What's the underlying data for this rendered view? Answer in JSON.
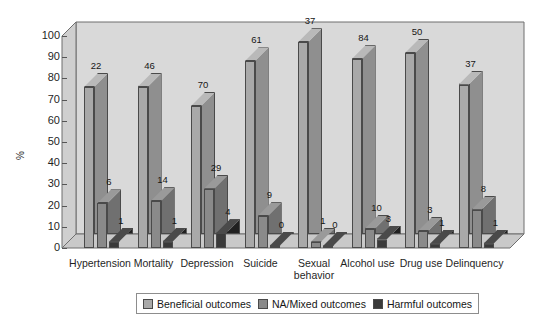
{
  "chart_data": {
    "type": "bar",
    "title": "",
    "xlabel": "",
    "ylabel": "%",
    "ylim": [
      0,
      100
    ],
    "yticks": [
      0,
      10,
      20,
      30,
      40,
      50,
      60,
      70,
      80,
      90,
      100
    ],
    "grid": false,
    "legend_position": "bottom",
    "categories": [
      "Hypertension",
      "Mortality",
      "Depression",
      "Suicide",
      "Sexual behavior",
      "Alcohol use",
      "Drug use",
      "Delinquency"
    ],
    "series": [
      {
        "name": "Beneficial outcomes",
        "color": "#a9a9a9",
        "values": [
          76,
          76,
          67,
          88,
          97,
          89,
          92,
          77
        ],
        "point_labels": [
          "22",
          "46",
          "70",
          "61",
          "37",
          "84",
          "50",
          "37"
        ]
      },
      {
        "name": "NA/Mixed outcomes",
        "color": "#8a8a8a",
        "values": [
          21,
          22,
          28,
          15,
          3,
          9,
          8,
          18
        ],
        "point_labels": [
          "6",
          "14",
          "29",
          "9",
          "1",
          "10",
          "3",
          "8"
        ]
      },
      {
        "name": "Harmful outcomes",
        "color": "#3a3a3a",
        "values": [
          3,
          3,
          7,
          1,
          1,
          4,
          2,
          2
        ],
        "point_labels": [
          "1",
          "1",
          "4",
          "0",
          "0",
          "3",
          "1",
          "1"
        ]
      }
    ],
    "annotation_note": "Numbers above each bar are study counts (N) for that outcome category."
  },
  "legend": {
    "items": [
      {
        "label": "Beneficial outcomes",
        "color": "#a9a9a9"
      },
      {
        "label": "NA/Mixed outcomes",
        "color": "#8a8a8a"
      },
      {
        "label": "Harmful outcomes",
        "color": "#3a3a3a"
      }
    ]
  },
  "colors": {
    "plot_background": "#dcdcdc",
    "wall_background": "#d2d2d2",
    "floor": "#c8c8c8",
    "axis_line": "#555555",
    "bar_outline": "#4a4a4a"
  }
}
